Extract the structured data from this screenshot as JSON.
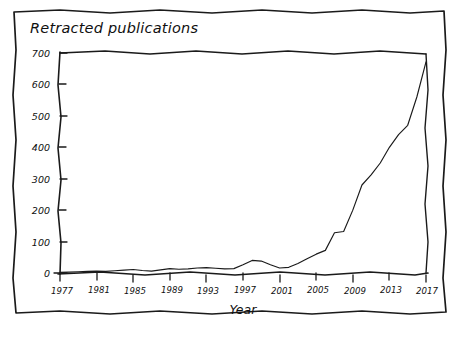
{
  "figure": {
    "title": "Retracted publications",
    "frame_style": "hand-drawn-wavy",
    "line_color": "#1a1a1a",
    "background_color": "#ffffff"
  },
  "chart_data": {
    "type": "line",
    "title": "Retracted publications",
    "xlabel": "Year",
    "ylabel": "",
    "xlim": [
      1977,
      2017
    ],
    "ylim": [
      0,
      700
    ],
    "grid": false,
    "legend": null,
    "xticks": [
      1977,
      1981,
      1985,
      1989,
      1993,
      1997,
      2001,
      2005,
      2009,
      2013,
      2017
    ],
    "yticks": [
      0,
      100,
      200,
      300,
      400,
      500,
      600,
      700
    ],
    "x": [
      1977,
      1978,
      1979,
      1980,
      1981,
      1982,
      1983,
      1984,
      1985,
      1986,
      1987,
      1988,
      1989,
      1990,
      1991,
      1992,
      1993,
      1994,
      1995,
      1996,
      1997,
      1998,
      1999,
      2000,
      2001,
      2002,
      2003,
      2004,
      2005,
      2006,
      2007,
      2008,
      2009,
      2010,
      2011,
      2012,
      2013,
      2014,
      2015,
      2016,
      2017
    ],
    "values": [
      2,
      3,
      4,
      5,
      6,
      5,
      7,
      9,
      11,
      8,
      6,
      10,
      14,
      12,
      13,
      16,
      17,
      15,
      13,
      14,
      26,
      40,
      38,
      26,
      16,
      18,
      30,
      45,
      60,
      72,
      128,
      132,
      200,
      280,
      312,
      350,
      400,
      440,
      470,
      560,
      672
    ],
    "annotations": []
  },
  "caption": ""
}
